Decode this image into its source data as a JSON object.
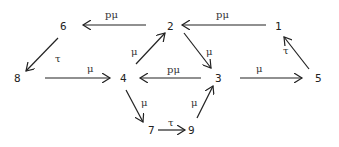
{
  "diagram": {
    "type": "state-transition-graph",
    "nodes": [
      {
        "id": "1",
        "label": "1",
        "x": 279,
        "y": 27
      },
      {
        "id": "2",
        "label": "2",
        "x": 171,
        "y": 27
      },
      {
        "id": "3",
        "label": "3",
        "x": 219,
        "y": 79
      },
      {
        "id": "4",
        "label": "4",
        "x": 124,
        "y": 79
      },
      {
        "id": "5",
        "label": "5",
        "x": 319,
        "y": 79
      },
      {
        "id": "6",
        "label": "6",
        "x": 64,
        "y": 27
      },
      {
        "id": "7",
        "label": "7",
        "x": 152,
        "y": 132
      },
      {
        "id": "8",
        "label": "8",
        "x": 18,
        "y": 79
      },
      {
        "id": "9",
        "label": "9",
        "x": 191,
        "y": 132
      }
    ],
    "edges": [
      {
        "from": "1",
        "to": "2",
        "label": "pμ"
      },
      {
        "from": "2",
        "to": "6",
        "label": "pμ"
      },
      {
        "from": "6",
        "to": "8",
        "label": "τ"
      },
      {
        "from": "8",
        "to": "4",
        "label": "μ"
      },
      {
        "from": "4",
        "to": "2",
        "label": "μ"
      },
      {
        "from": "2",
        "to": "3",
        "label": "μ"
      },
      {
        "from": "3",
        "to": "4",
        "label": "pμ"
      },
      {
        "from": "3",
        "to": "5",
        "label": "μ"
      },
      {
        "from": "5",
        "to": "1",
        "label": "τ"
      },
      {
        "from": "4",
        "to": "7",
        "label": "μ"
      },
      {
        "from": "7",
        "to": "9",
        "label": "τ"
      },
      {
        "from": "9",
        "to": "3",
        "label": "μ"
      }
    ]
  },
  "labels": {
    "n1": "1",
    "n2": "2",
    "n3": "3",
    "n4": "4",
    "n5": "5",
    "n6": "6",
    "n7": "7",
    "n8": "8",
    "n9": "9",
    "e_1_2": "pμ",
    "e_2_6": "pμ",
    "e_6_8": "τ",
    "e_8_4": "μ",
    "e_4_2": "μ",
    "e_2_3": "μ",
    "e_3_4": "pμ",
    "e_3_5": "μ",
    "e_5_1": "τ",
    "e_4_7": "μ",
    "e_7_9": "τ",
    "e_9_3": "μ"
  }
}
